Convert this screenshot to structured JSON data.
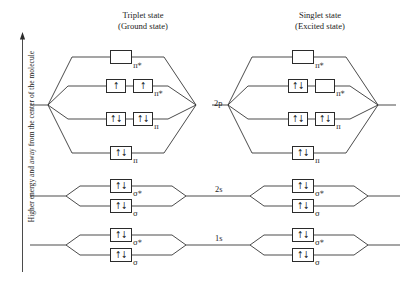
{
  "figure": {
    "axis_label": "Higher energy and away from the center of the molecule",
    "background_color": "#ffffff",
    "line_color": "#2b2b2b"
  },
  "columns": [
    {
      "id": "triplet",
      "title_line1": "Triplet state",
      "title_line2": "(Ground state)"
    },
    {
      "id": "singlet",
      "title_line1": "Singlet state",
      "title_line2": "(Excited state)"
    }
  ],
  "atomic_orbital_labels": [
    {
      "id": "ao-2p",
      "label": "2p"
    },
    {
      "id": "ao-2s",
      "label": "2s"
    },
    {
      "id": "ao-1s",
      "label": "1s"
    }
  ],
  "electron_glyphs": {
    "pair": "↑↓",
    "single_up": "↑",
    "empty": ""
  },
  "orbital_symbols": {
    "pi": "π",
    "pi_star": "π*",
    "sigma": "σ",
    "sigma_star": "σ*"
  },
  "triplet": {
    "shell_2p": [
      {
        "id": "t-2p-pistar-upper",
        "symbol": "π*",
        "starred": true,
        "boxes": [
          ""
        ]
      },
      {
        "id": "t-2p-pistar-lower",
        "symbol": "π*",
        "starred": true,
        "boxes": [
          "↑",
          "↑"
        ]
      },
      {
        "id": "t-2p-pi-upper",
        "symbol": "π",
        "starred": false,
        "boxes": [
          "↑↓",
          "↑↓"
        ]
      },
      {
        "id": "t-2p-pi-lower",
        "symbol": "π",
        "starred": false,
        "boxes": [
          "↑↓"
        ]
      }
    ],
    "shell_2s": [
      {
        "id": "t-2s-sigmastar",
        "symbol": "σ*",
        "starred": true,
        "boxes": [
          "↑↓"
        ]
      },
      {
        "id": "t-2s-sigma",
        "symbol": "σ",
        "starred": false,
        "boxes": [
          "↑↓"
        ]
      }
    ],
    "shell_1s": [
      {
        "id": "t-1s-sigmastar",
        "symbol": "σ*",
        "starred": true,
        "boxes": [
          "↑↓"
        ]
      },
      {
        "id": "t-1s-sigma",
        "symbol": "σ",
        "starred": false,
        "boxes": [
          "↑↓"
        ]
      }
    ]
  },
  "singlet": {
    "shell_2p": [
      {
        "id": "s-2p-pistar-upper",
        "symbol": "π*",
        "starred": true,
        "boxes": [
          ""
        ]
      },
      {
        "id": "s-2p-pistar-lower",
        "symbol": "π*",
        "starred": true,
        "boxes": [
          "↑↓",
          ""
        ]
      },
      {
        "id": "s-2p-pi-upper",
        "symbol": "π",
        "starred": false,
        "boxes": [
          "↑↓",
          "↑↓"
        ]
      },
      {
        "id": "s-2p-pi-lower",
        "symbol": "π",
        "starred": false,
        "boxes": [
          "↑↓"
        ]
      }
    ],
    "shell_2s": [
      {
        "id": "s-2s-sigmastar",
        "symbol": "σ*",
        "starred": true,
        "boxes": [
          "↑↓"
        ]
      },
      {
        "id": "s-2s-sigma",
        "symbol": "σ",
        "starred": false,
        "boxes": [
          "↑↓"
        ]
      }
    ],
    "shell_1s": [
      {
        "id": "s-1s-sigmastar",
        "symbol": "σ*",
        "starred": true,
        "boxes": [
          "↑↓"
        ]
      },
      {
        "id": "s-1s-sigma",
        "symbol": "σ",
        "starred": false,
        "boxes": [
          "↑↓"
        ]
      }
    ]
  }
}
